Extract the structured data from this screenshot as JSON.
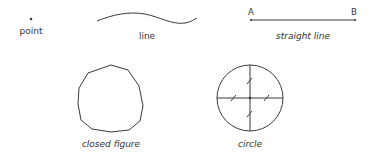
{
  "diagram": {
    "stroke_color": "#3a3a3a",
    "figures": [
      {
        "id": "point",
        "label": "point"
      },
      {
        "id": "line",
        "label": "line"
      },
      {
        "id": "straight-line",
        "label": "straight line",
        "endpoints": [
          "A",
          "B"
        ]
      },
      {
        "id": "closed-figure",
        "label": "closed figure"
      },
      {
        "id": "circle",
        "label": "circle"
      }
    ]
  }
}
